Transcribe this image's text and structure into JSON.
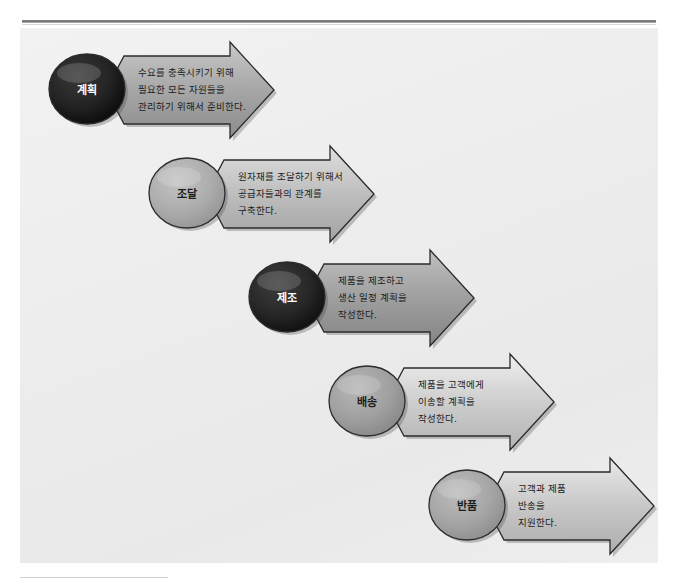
{
  "diagram": {
    "type": "chevron-process-flow",
    "background_color": "#eeeeee",
    "stages": [
      {
        "id": "plan",
        "label": "계획",
        "ellipse_style": "dark",
        "ellipse_color": "#1f1f1f",
        "arrow_color": "#a6a6a6",
        "lines": [
          "수요를 충족시키기 위해",
          "필요한 모든 자원들을",
          "관리하기 위해서 준비한다."
        ]
      },
      {
        "id": "source",
        "label": "조달",
        "ellipse_style": "light",
        "ellipse_color": "#a9a9a9",
        "arrow_color": "#bdbdbd",
        "lines": [
          "원자재를 조달하기 위해서",
          "공급자들과의 관계를",
          "구축한다."
        ]
      },
      {
        "id": "make",
        "label": "제조",
        "ellipse_style": "dark",
        "ellipse_color": "#232323",
        "arrow_color": "#9e9e9e",
        "lines": [
          "제품을 제조하고",
          "생산 일정 계획을",
          "작성한다."
        ]
      },
      {
        "id": "deliver",
        "label": "배송",
        "ellipse_style": "light",
        "ellipse_color": "#9c9c9c",
        "arrow_color": "#cdcdcd",
        "lines": [
          "제품을 고객에게",
          "이송할 계획을",
          "작성한다."
        ]
      },
      {
        "id": "return",
        "label": "반품",
        "ellipse_style": "light",
        "ellipse_color": "#a2a2a2",
        "arrow_color": "#c7c7c7",
        "lines": [
          "고객과 제품",
          "반송을",
          "지원한다."
        ]
      }
    ]
  }
}
